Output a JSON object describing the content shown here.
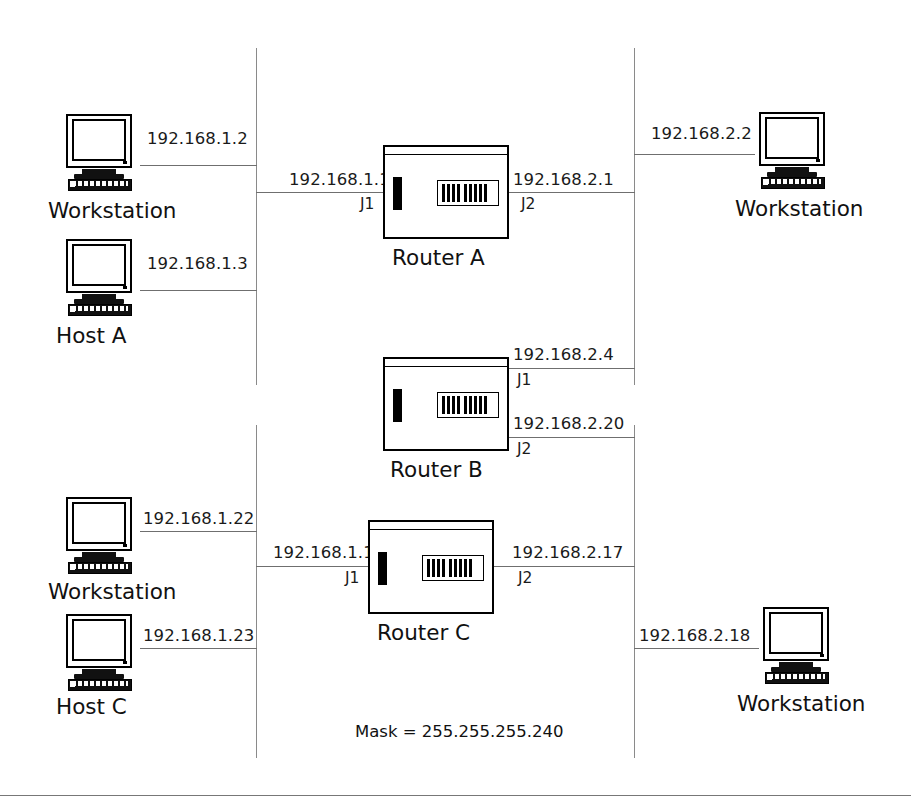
{
  "diagram": {
    "mask_note": "Mask = 255.255.255.240",
    "segments": {
      "left_backbone": "192.168.1.x segment",
      "right_backbone": "192.168.2.x segment"
    },
    "nodes": [
      {
        "id": "ws-1",
        "type": "workstation",
        "label": "Workstation",
        "ip": "192.168.1.2"
      },
      {
        "id": "host-a",
        "type": "workstation",
        "label": "Host A",
        "ip": "192.168.1.3"
      },
      {
        "id": "ws-2",
        "type": "workstation",
        "label": "Workstation",
        "ip": "192.168.2.2"
      },
      {
        "id": "ws-3",
        "type": "workstation",
        "label": "Workstation",
        "ip": "192.168.1.22"
      },
      {
        "id": "host-c",
        "type": "workstation",
        "label": "Host C",
        "ip": "192.168.1.23"
      },
      {
        "id": "ws-4",
        "type": "workstation",
        "label": "Workstation",
        "ip": "192.168.2.18"
      }
    ],
    "routers": [
      {
        "id": "router-a",
        "label": "Router A",
        "left_ip": "192.168.1.1",
        "left_jack": "J1",
        "right_ip": "192.168.2.1",
        "right_jack": "J2"
      },
      {
        "id": "router-b",
        "label": "Router B",
        "top_right_ip": "192.168.2.4",
        "top_right_jack": "J1",
        "bottom_right_ip": "192.168.2.20",
        "bottom_right_jack": "J2"
      },
      {
        "id": "router-c",
        "label": "Router C",
        "left_ip": "192.168.1.17",
        "left_jack": "J1",
        "right_ip": "192.168.2.17",
        "right_jack": "J2"
      }
    ],
    "colors": {
      "ink": "#111111",
      "line": "#6f6f6f",
      "backbone": "#8a8a8a",
      "background": "#ffffff"
    }
  }
}
